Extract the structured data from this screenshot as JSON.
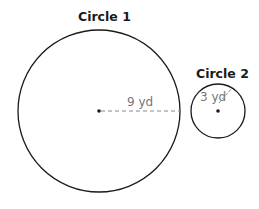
{
  "diagram": {
    "circle1": {
      "title": "Circle 1",
      "radius_label": "9 yd",
      "center": [
        99,
        111
      ],
      "radius_px": 81
    },
    "circle2": {
      "title": "Circle 2",
      "radius_label": "3 yd",
      "center": [
        218,
        111
      ],
      "radius_px": 27
    },
    "colors": {
      "stroke": "#1a1a1a",
      "label": "#777777",
      "dashed": "#888888"
    }
  }
}
